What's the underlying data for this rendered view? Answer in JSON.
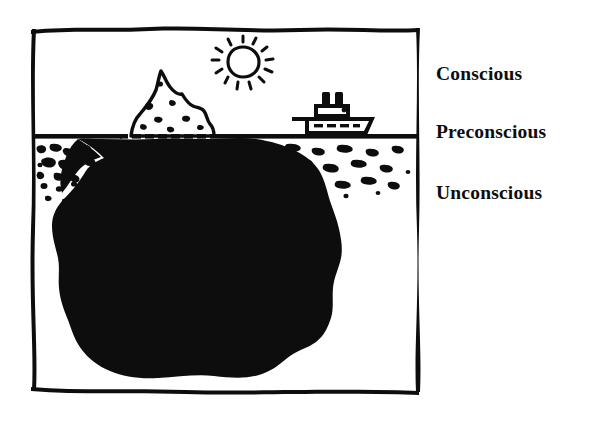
{
  "figure": {
    "title_alt": "Freud iceberg model of the mind",
    "style": "hand-drawn ink line illustration",
    "background_color": "#ffffff",
    "ink_color": "#0d0d0d",
    "frame": {
      "name": "hand-drawn-border",
      "left": 31,
      "top": 28,
      "right": 419,
      "bottom": 391
    },
    "waterline": {
      "label": "water-surface",
      "y": 136,
      "dashed_segment": {
        "from_x": 118,
        "to_x": 210,
        "note": "submerged outline of iceberg tip shown as white dashes"
      }
    },
    "scene_elements": [
      {
        "name": "sun",
        "cx": 243,
        "cy": 62,
        "r": 15,
        "rays": 12
      },
      {
        "name": "ship",
        "x": 300,
        "y": 97,
        "width": 70,
        "height": 38,
        "smokestacks": 2
      },
      {
        "name": "iceberg-tip",
        "peak_x": 160,
        "peak_y": 71,
        "base_y": 136
      },
      {
        "name": "iceberg-submerged-mass",
        "top_y": 136,
        "bottom_y": 379
      },
      {
        "name": "water-texture-left",
        "region": "preconscious band left of iceberg"
      },
      {
        "name": "water-texture-right",
        "region": "preconscious band right of iceberg"
      }
    ]
  },
  "labels": {
    "conscious": "Conscious",
    "preconscious": "Preconscious",
    "unconscious": "Unconscious"
  }
}
